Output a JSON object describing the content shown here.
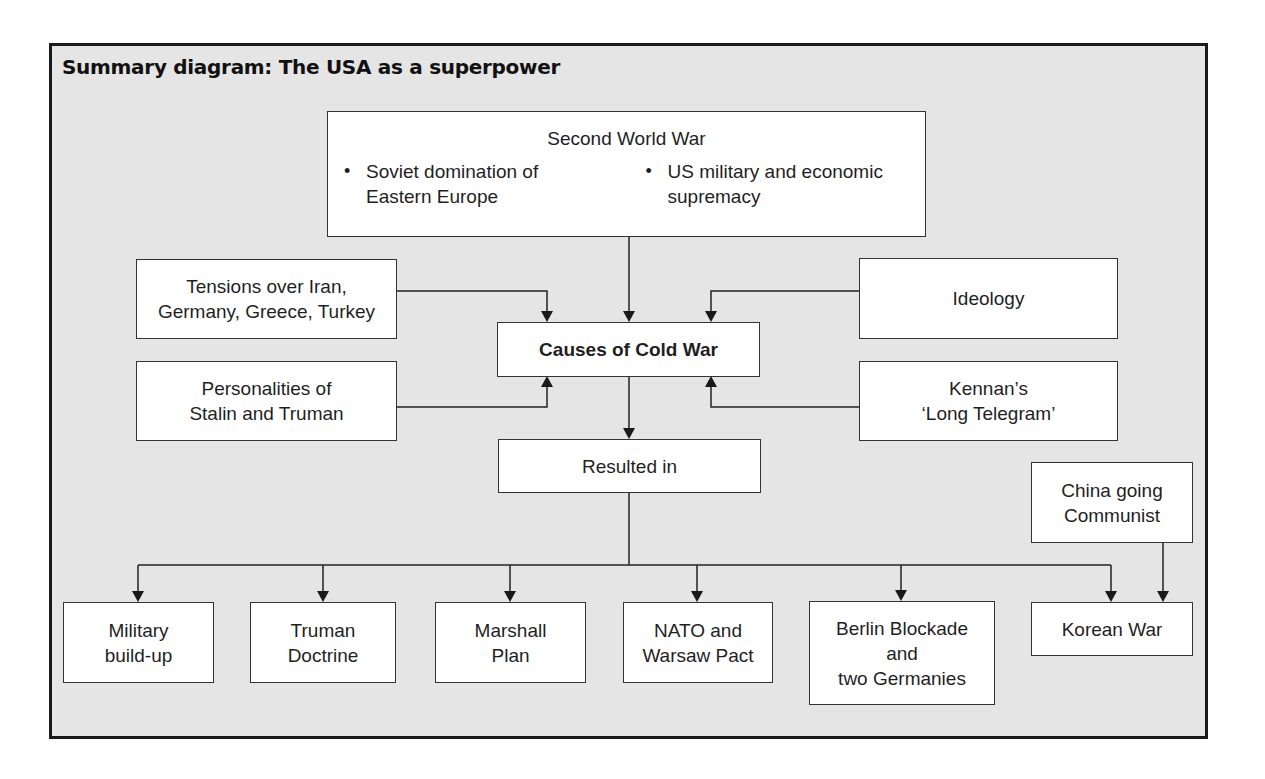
{
  "title": "Summary diagram: The USA as a superpower",
  "top": {
    "heading": "Second World War",
    "bullets": [
      {
        "line1": "Soviet domination of",
        "line2": "Eastern Europe"
      },
      {
        "line1": "US military and economic",
        "line2": "supremacy"
      }
    ]
  },
  "causes": {
    "left": [
      {
        "line1": "Tensions over Iran,",
        "line2": "Germany, Greece, Turkey"
      },
      {
        "line1": "Personalities of",
        "line2": "Stalin and Truman"
      }
    ],
    "right": [
      {
        "line1": "Ideology"
      },
      {
        "line1": "Kennan’s",
        "line2": "‘Long Telegram’"
      }
    ],
    "center": "Causes of Cold War"
  },
  "resulted": "Resulted in",
  "china": {
    "line1": "China going",
    "line2": "Communist"
  },
  "outcomes": [
    {
      "line1": "Military",
      "line2": "build-up"
    },
    {
      "line1": "Truman",
      "line2": "Doctrine"
    },
    {
      "line1": "Marshall",
      "line2": "Plan"
    },
    {
      "line1": "NATO and",
      "line2": "Warsaw Pact"
    },
    {
      "line1": "Berlin Blockade",
      "line2": "and",
      "line3": "two Germanies"
    },
    {
      "line1": "Korean War"
    }
  ],
  "colors": {
    "background": "#e5e5e5",
    "box": "#ffffff",
    "line": "#222222"
  }
}
